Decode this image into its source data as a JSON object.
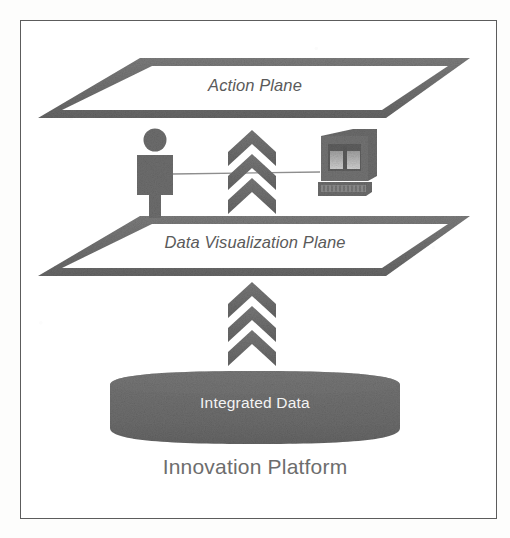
{
  "figure": {
    "caption": "Innovation Platform",
    "background_color": "#ffffff",
    "frame_color": "#5c5c5c",
    "shape_fill": "#6f6f6f",
    "label_color": "#5a5a5a",
    "inverse_label_color": "#f4f4f4"
  },
  "layers": {
    "action_plane": {
      "label": "Action Plane",
      "shape": "parallelogram-outline"
    },
    "data_visualization_plane": {
      "label": "Data Visualization Plane",
      "shape": "parallelogram-outline"
    },
    "integrated_data": {
      "label": "Integrated Data",
      "shape": "cylinder"
    }
  },
  "actors": {
    "person": {
      "name": "person-icon"
    },
    "monitor": {
      "name": "monitor-icon"
    },
    "link": {
      "name": "connector-line"
    }
  },
  "flows": [
    {
      "name": "flow-data-to-action",
      "label": "",
      "direction": "up",
      "chevrons": 3
    },
    {
      "name": "flow-integrated-to-dataviz",
      "label": "",
      "direction": "up",
      "chevrons": 3
    }
  ]
}
